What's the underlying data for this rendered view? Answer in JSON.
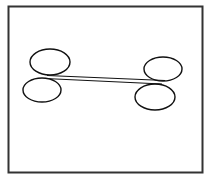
{
  "diagram": {
    "frame": {
      "x": 8.5,
      "y": 6.5,
      "width": 194,
      "height": 166,
      "stroke": "#333333",
      "stroke_width": 2
    },
    "ellipses": [
      {
        "name": "top-left-ellipse",
        "cx": 50,
        "cy": 62,
        "rx": 20,
        "ry": 13
      },
      {
        "name": "bottom-left-ellipse",
        "cx": 42,
        "cy": 90,
        "rx": 19,
        "ry": 12
      },
      {
        "name": "top-right-ellipse",
        "cx": 163,
        "cy": 69,
        "rx": 19,
        "ry": 12
      },
      {
        "name": "bottom-right-ellipse",
        "cx": 155,
        "cy": 97,
        "rx": 20,
        "ry": 13
      }
    ],
    "lines": [
      {
        "name": "upper-connector-line",
        "x1": 47,
        "y1": 75.5,
        "x2": 165,
        "y2": 80.5
      },
      {
        "name": "lower-connector-line",
        "x1": 45,
        "y1": 78.5,
        "x2": 162,
        "y2": 84
      }
    ],
    "stroke_color": "#111111"
  }
}
